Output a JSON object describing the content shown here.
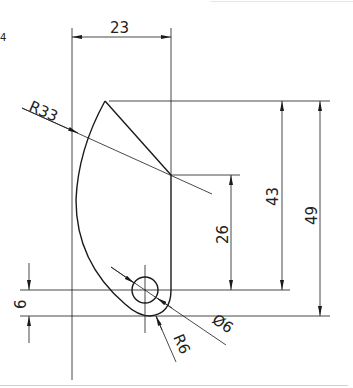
{
  "figure": {
    "type": "engineering-drawing",
    "colors": {
      "line": "#1a1a1a",
      "background": "#ffffff"
    },
    "corner_mark": "4",
    "dimensions": {
      "width_top": "23",
      "radius_large": "R33",
      "height_26": "26",
      "height_43": "43",
      "height_49": "49",
      "offset_6": "6",
      "hole_diameter": "Ø6",
      "fillet_radius": "R6"
    }
  }
}
